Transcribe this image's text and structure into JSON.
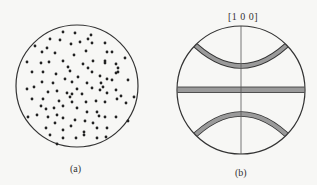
{
  "figure": {
    "panel_a": {
      "caption": "(a)",
      "description": "Random distribution of points within a circular projection",
      "circle": {
        "cx": 77,
        "cy": 86,
        "r": 61
      },
      "dots": [
        [
          63,
          32
        ],
        [
          75,
          33
        ],
        [
          91,
          35
        ],
        [
          35,
          46
        ],
        [
          50,
          39
        ],
        [
          60,
          40
        ],
        [
          71,
          44
        ],
        [
          80,
          42
        ],
        [
          88,
          39
        ],
        [
          92,
          43
        ],
        [
          105,
          43
        ],
        [
          42,
          52
        ],
        [
          47,
          48
        ],
        [
          55,
          53
        ],
        [
          86,
          51
        ],
        [
          107,
          52
        ],
        [
          112,
          52
        ],
        [
          27,
          62
        ],
        [
          41,
          63
        ],
        [
          49,
          62
        ],
        [
          63,
          61
        ],
        [
          74,
          55
        ],
        [
          83,
          64
        ],
        [
          93,
          61
        ],
        [
          105,
          61
        ],
        [
          125,
          58
        ],
        [
          32,
          72
        ],
        [
          43,
          72
        ],
        [
          56,
          74
        ],
        [
          68,
          67
        ],
        [
          70,
          71
        ],
        [
          88,
          68
        ],
        [
          92,
          72
        ],
        [
          100,
          76
        ],
        [
          105,
          63
        ],
        [
          116,
          64
        ],
        [
          118,
          68
        ],
        [
          118,
          72
        ],
        [
          116,
          73
        ],
        [
          78,
          77
        ],
        [
          42,
          82
        ],
        [
          53,
          83
        ],
        [
          65,
          79
        ],
        [
          72,
          82
        ],
        [
          87,
          83
        ],
        [
          101,
          83
        ],
        [
          107,
          79
        ],
        [
          112,
          80
        ],
        [
          128,
          80
        ],
        [
          27,
          89
        ],
        [
          34,
          87
        ],
        [
          48,
          92
        ],
        [
          57,
          91
        ],
        [
          67,
          93
        ],
        [
          72,
          94
        ],
        [
          77,
          89
        ],
        [
          82,
          94
        ],
        [
          92,
          88
        ],
        [
          100,
          90
        ],
        [
          103,
          87
        ],
        [
          107,
          93
        ],
        [
          116,
          90
        ],
        [
          32,
          99
        ],
        [
          43,
          99
        ],
        [
          59,
          101
        ],
        [
          70,
          97
        ],
        [
          72,
          102
        ],
        [
          86,
          102
        ],
        [
          96,
          101
        ],
        [
          105,
          102
        ],
        [
          117,
          99
        ],
        [
          121,
          96
        ],
        [
          126,
          103
        ],
        [
          134,
          97
        ],
        [
          41,
          106
        ],
        [
          46,
          109
        ],
        [
          54,
          108
        ],
        [
          63,
          106
        ],
        [
          77,
          108
        ],
        [
          87,
          112
        ],
        [
          97,
          112
        ],
        [
          99,
          116
        ],
        [
          105,
          117
        ],
        [
          28,
          117
        ],
        [
          37,
          115
        ],
        [
          48,
          117
        ],
        [
          57,
          115
        ],
        [
          63,
          118
        ],
        [
          75,
          120
        ],
        [
          85,
          121
        ],
        [
          93,
          123
        ],
        [
          116,
          117
        ],
        [
          128,
          121
        ],
        [
          46,
          128
        ],
        [
          55,
          123
        ],
        [
          63,
          130
        ],
        [
          71,
          126
        ],
        [
          84,
          132
        ],
        [
          97,
          128
        ],
        [
          107,
          128
        ],
        [
          50,
          135
        ],
        [
          63,
          138
        ],
        [
          76,
          138
        ],
        [
          84,
          135
        ],
        [
          97,
          138
        ],
        [
          106,
          137
        ],
        [
          57,
          144
        ]
      ]
    },
    "panel_b": {
      "caption": "(b)",
      "axis_label": "[1 0 0]",
      "description": "Stereographic projection with great-circle band and two small-circle bands",
      "circle": {
        "cx": 241,
        "cy": 90,
        "r": 64
      },
      "band_fill": "#9a9a9a",
      "line_color": "#333333"
    }
  }
}
